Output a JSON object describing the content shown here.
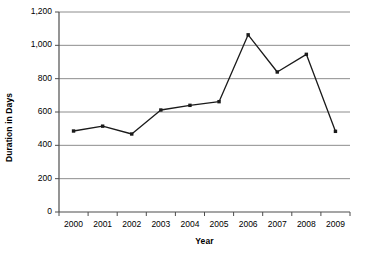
{
  "chart_data": {
    "type": "line",
    "title": "",
    "xlabel": "Year",
    "ylabel": "Duration in Days",
    "categories": [
      "2000",
      "2001",
      "2002",
      "2003",
      "2004",
      "2005",
      "2006",
      "2007",
      "2008",
      "2009"
    ],
    "values": [
      486,
      515,
      468,
      612,
      640,
      662,
      1063,
      840,
      946,
      484
    ],
    "series": [
      {
        "name": "Duration in Days",
        "values": [
          486,
          515,
          468,
          612,
          640,
          662,
          1063,
          840,
          946,
          484
        ]
      }
    ],
    "ylim": [
      0,
      1200
    ],
    "ytick_labels": [
      "0",
      "200",
      "400",
      "600",
      "800",
      "1,000",
      "1,200"
    ],
    "ytick_values": [
      0,
      200,
      400,
      600,
      800,
      1000,
      1200
    ],
    "grid": "horizontal",
    "legend": "none",
    "line_color": "#1a1a1a",
    "marker_color": "#1a1a1a",
    "marker_shape": "square",
    "grid_color": "#808080",
    "axis_color": "#4d4d4d",
    "background": "#ffffff"
  }
}
